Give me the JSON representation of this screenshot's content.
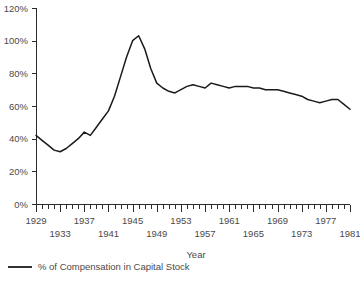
{
  "chart_data": {
    "type": "line",
    "title": "",
    "xlabel": "Year",
    "ylabel": "",
    "ylim": [
      0,
      120
    ],
    "xlim": [
      1929,
      1981
    ],
    "ytick_labels": [
      "0%",
      "20%",
      "40%",
      "60%",
      "80%",
      "100%",
      "120%"
    ],
    "ytick_values": [
      0,
      20,
      40,
      60,
      80,
      100,
      120
    ],
    "xtick_labels_upper": [
      "1929",
      "1937",
      "1945",
      "1953",
      "1961",
      "1969",
      "1977"
    ],
    "xtick_values_upper": [
      1929,
      1937,
      1945,
      1953,
      1961,
      1969,
      1977
    ],
    "xtick_labels_lower": [
      "1933",
      "1941",
      "1949",
      "1957",
      "1965",
      "1973",
      "1981"
    ],
    "xtick_values_lower": [
      1933,
      1941,
      1949,
      1957,
      1965,
      1973,
      1981
    ],
    "minor_tick_interval": 1,
    "major_tick_interval": 4,
    "grid": false,
    "legend_position": "bottom-left",
    "series": [
      {
        "name": "% of Compensation in Capital Stock",
        "color": "#1a1a1a",
        "x": [
          1929,
          1930,
          1931,
          1932,
          1933,
          1934,
          1935,
          1936,
          1937,
          1938,
          1939,
          1940,
          1941,
          1942,
          1943,
          1944,
          1945,
          1946,
          1947,
          1948,
          1949,
          1950,
          1951,
          1952,
          1953,
          1954,
          1955,
          1956,
          1957,
          1958,
          1959,
          1960,
          1961,
          1962,
          1963,
          1964,
          1965,
          1966,
          1967,
          1968,
          1969,
          1970,
          1971,
          1972,
          1973,
          1974,
          1975,
          1976,
          1977,
          1978,
          1979,
          1980,
          1981
        ],
        "values": [
          42,
          39,
          36,
          33,
          32,
          34,
          37,
          40,
          44,
          42,
          47,
          52,
          57,
          66,
          78,
          90,
          100,
          103,
          95,
          83,
          74,
          71,
          69,
          68,
          70,
          72,
          73,
          72,
          71,
          74,
          73,
          72,
          71,
          72,
          72,
          72,
          71,
          71,
          70,
          70,
          70,
          69,
          68,
          67,
          66,
          64,
          63,
          62,
          63,
          64,
          64,
          61,
          58
        ]
      }
    ]
  },
  "legend": {
    "items": [
      {
        "label": "% of Compensation in Capital Stock",
        "color": "#1a1a1a"
      }
    ]
  },
  "axis": {
    "x_title": "Year"
  }
}
